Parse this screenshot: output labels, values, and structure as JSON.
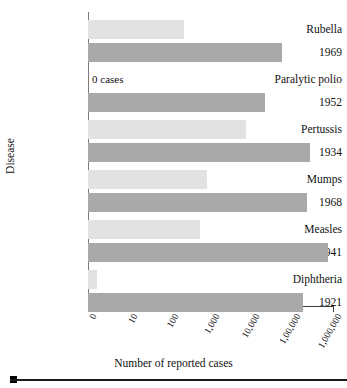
{
  "chart_data": {
    "type": "bar",
    "orientation": "horizontal",
    "title": "",
    "xlabel": "Number of reported cases",
    "ylabel": "Disease",
    "xscale": "log",
    "grid": false,
    "legend": "none",
    "axis_tick_labels": [
      "0",
      "10",
      "100",
      "1,000",
      "10,000",
      "1,00,000",
      "1,000,000"
    ],
    "axis_tick_values": [
      0,
      10,
      100,
      1000,
      10000,
      100000,
      1000000
    ],
    "xlim": [
      0,
      1000000
    ],
    "colors": {
      "recent_bar": "#e2e2e2",
      "peak_bar": "#a9a9a9",
      "axis": "#3a3a3a",
      "text": "#111111"
    },
    "series": [
      {
        "name": "Recent year reported cases",
        "color": "#e2e2e2"
      },
      {
        "name": "Peak year reported cases",
        "color": "#a9a9a9"
      }
    ],
    "groups": [
      {
        "disease": "Rubella",
        "peak_year": "1969",
        "recent_value": 200,
        "recent_label": "",
        "peak_value": 57000,
        "recent_px": 96,
        "peak_px": 194,
        "annotation": ""
      },
      {
        "disease": "Paralytic polio",
        "peak_year": "1952",
        "recent_value": 0,
        "recent_label": "0 cases",
        "peak_value": 21000,
        "recent_px": 0,
        "peak_px": 177,
        "annotation": "0 cases"
      },
      {
        "disease": "Pertussis",
        "peak_year": "1934",
        "recent_value": 12000,
        "recent_label": "",
        "peak_value": 265000,
        "recent_px": 158,
        "peak_px": 222,
        "annotation": ""
      },
      {
        "disease": "Mumps",
        "peak_year": "1968",
        "recent_value": 2000,
        "recent_label": "",
        "peak_value": 152000,
        "recent_px": 119,
        "peak_px": 219,
        "annotation": ""
      },
      {
        "disease": "Measles",
        "peak_year": "1941",
        "recent_value": 700,
        "recent_label": "",
        "peak_value": 894000,
        "recent_px": 112,
        "peak_px": 240,
        "annotation": ""
      },
      {
        "disease": "Diphtheria",
        "peak_year": "1921",
        "recent_value": 1,
        "recent_label": "",
        "peak_value": 206000,
        "recent_px": 9,
        "peak_px": 215,
        "annotation": ""
      }
    ]
  },
  "axis": {
    "x_title": "Number of reported cases",
    "y_title": "Disease"
  },
  "footer": {
    "bullet": "square-bullet"
  }
}
